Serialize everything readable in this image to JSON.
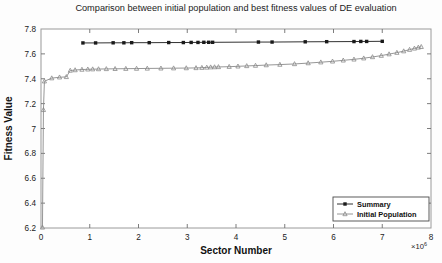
{
  "chart_data": {
    "type": "line",
    "title": "Comparison between initial population and best fitness values of DE evaluation",
    "xlabel": "Sector Number",
    "ylabel": "Fitness Value",
    "xlim": [
      0,
      8
    ],
    "ylim": [
      6.2,
      7.8
    ],
    "x_exponent_base": "×10",
    "x_exponent_power": "6",
    "x_ticks": [
      "0",
      "1",
      "2",
      "3",
      "4",
      "5",
      "6",
      "7",
      "8"
    ],
    "y_ticks": [
      "6.2",
      "6.4",
      "6.6",
      "6.8",
      "7",
      "7.2",
      "7.4",
      "7.6",
      "7.8"
    ],
    "grid": false,
    "legend_position": "lower-right",
    "series": [
      {
        "name": "Summary",
        "marker": "square",
        "color": "#1a1a1a",
        "points": [
          [
            0.86,
            7.688
          ],
          [
            1.12,
            7.688
          ],
          [
            1.48,
            7.689
          ],
          [
            1.7,
            7.689
          ],
          [
            1.86,
            7.69
          ],
          [
            2.22,
            7.69
          ],
          [
            2.62,
            7.691
          ],
          [
            2.92,
            7.691
          ],
          [
            3.08,
            7.692
          ],
          [
            3.22,
            7.692
          ],
          [
            3.34,
            7.693
          ],
          [
            3.44,
            7.693
          ],
          [
            3.52,
            7.693
          ],
          [
            4.46,
            7.695
          ],
          [
            4.74,
            7.695
          ],
          [
            5.42,
            7.697
          ],
          [
            5.86,
            7.698
          ],
          [
            6.42,
            7.699
          ],
          [
            6.56,
            7.7
          ],
          [
            6.68,
            7.7
          ],
          [
            7.0,
            7.701
          ]
        ]
      },
      {
        "name": "Initial Population",
        "marker": "triangle",
        "color": "#8a8a8a",
        "points": [
          [
            0.03,
            6.205
          ],
          [
            0.05,
            7.15
          ],
          [
            0.07,
            7.38
          ],
          [
            0.22,
            7.405
          ],
          [
            0.38,
            7.412
          ],
          [
            0.52,
            7.415
          ],
          [
            0.6,
            7.466
          ],
          [
            0.7,
            7.47
          ],
          [
            0.84,
            7.474
          ],
          [
            0.96,
            7.476
          ],
          [
            1.06,
            7.477
          ],
          [
            1.18,
            7.478
          ],
          [
            1.34,
            7.479
          ],
          [
            1.52,
            7.48
          ],
          [
            1.74,
            7.481
          ],
          [
            1.96,
            7.482
          ],
          [
            2.18,
            7.483
          ],
          [
            2.46,
            7.484
          ],
          [
            2.72,
            7.485
          ],
          [
            2.98,
            7.486
          ],
          [
            3.18,
            7.487
          ],
          [
            3.3,
            7.489
          ],
          [
            3.4,
            7.491
          ],
          [
            3.48,
            7.493
          ],
          [
            3.56,
            7.494
          ],
          [
            3.64,
            7.495
          ],
          [
            3.86,
            7.497
          ],
          [
            4.04,
            7.5
          ],
          [
            4.22,
            7.503
          ],
          [
            4.4,
            7.506
          ],
          [
            4.62,
            7.51
          ],
          [
            4.9,
            7.514
          ],
          [
            5.2,
            7.519
          ],
          [
            5.48,
            7.526
          ],
          [
            5.74,
            7.533
          ],
          [
            5.98,
            7.54
          ],
          [
            6.2,
            7.548
          ],
          [
            6.42,
            7.556
          ],
          [
            6.62,
            7.565
          ],
          [
            6.8,
            7.575
          ],
          [
            6.98,
            7.586
          ],
          [
            7.14,
            7.598
          ],
          [
            7.3,
            7.61
          ],
          [
            7.44,
            7.622
          ],
          [
            7.56,
            7.634
          ],
          [
            7.66,
            7.644
          ],
          [
            7.74,
            7.652
          ],
          [
            7.8,
            7.657
          ]
        ]
      }
    ]
  }
}
